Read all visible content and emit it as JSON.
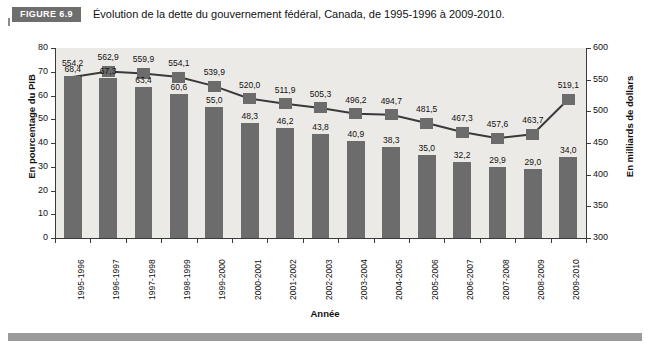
{
  "figure": {
    "badge": "FIGURE 6.9",
    "title": "Évolution de la dette du gouvernement fédéral, Canada, de 1995-1996 à 2009-2010."
  },
  "chart_data": {
    "type": "bar",
    "title": "Évolution de la dette du gouvernement fédéral, Canada, de 1995-1996 à 2009-2010.",
    "xlabel": "Année",
    "ylabel": "En pourcentage du PIB",
    "y2label": "En milliards de dollars",
    "ylim": [
      0,
      80
    ],
    "y2lim": [
      300,
      600
    ],
    "yticks": [
      "0",
      "10",
      "20",
      "30",
      "40",
      "50",
      "60",
      "70",
      "80"
    ],
    "y2ticks": [
      "300",
      "350",
      "400",
      "450",
      "500",
      "550",
      "600"
    ],
    "grid": false,
    "legend": "none",
    "categories": [
      "1995-1996",
      "1996-1997",
      "1997-1998",
      "1998-1999",
      "1999-2000",
      "2000-2001",
      "2001-2002",
      "2002-2003",
      "2003-2004",
      "2004-2005",
      "2005-2006",
      "2006-2007",
      "2007-2008",
      "2008-2009",
      "2009-2010"
    ],
    "series": [
      {
        "name": "En pourcentage du PIB",
        "type": "bar",
        "axis": "left",
        "color": "#6c6c6c",
        "values": [
          68.4,
          67.3,
          63.4,
          60.6,
          55.0,
          48.3,
          46.2,
          43.8,
          40.9,
          38.3,
          35.0,
          32.2,
          29.9,
          29.0,
          34.0
        ],
        "labels": [
          "68,4",
          "67,3",
          "63,4",
          "60,6",
          "55,0",
          "48,3",
          "46,2",
          "43,8",
          "40,9",
          "38,3",
          "35,0",
          "32,2",
          "29,9",
          "29,0",
          "34,0"
        ]
      },
      {
        "name": "En milliards de dollars",
        "type": "line",
        "axis": "right",
        "color": "#3a3a3a",
        "values": [
          554.2,
          562.9,
          559.9,
          554.1,
          539.9,
          520.0,
          511.9,
          505.3,
          496.2,
          494.7,
          481.5,
          467.3,
          457.6,
          463.7,
          519.1
        ],
        "labels": [
          "554,2",
          "562,9",
          "559,9",
          "554,1",
          "539,9",
          "520,0",
          "511,9",
          "505,3",
          "496,2",
          "494,7",
          "481,5",
          "467,3",
          "457,6",
          "463,7",
          "519,1"
        ]
      }
    ]
  }
}
